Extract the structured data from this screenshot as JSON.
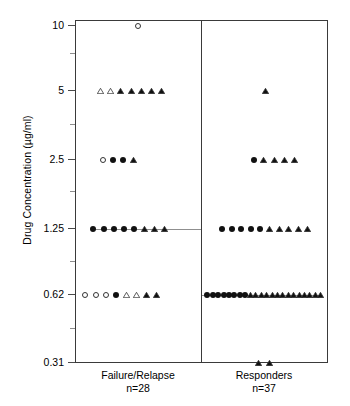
{
  "chart_data": {
    "type": "scatter",
    "title": "",
    "xlabel": "",
    "ylabel": "Drug Concentration (µg/ml)",
    "yscale": "log2",
    "ytick_labels": [
      "10",
      "5",
      "2.5",
      "1.25",
      "0.62",
      "0.31"
    ],
    "ytick_values": [
      10,
      5,
      2.5,
      1.25,
      0.62,
      0.31
    ],
    "ylim": [
      0.31,
      12
    ],
    "grid": false,
    "legend": "none",
    "reference_lines": [
      {
        "group": "Failure/Relapse",
        "value": 1.25,
        "label": ""
      },
      {
        "group": "Responders",
        "value": 0.62,
        "label": ""
      }
    ],
    "marker_kinds": [
      "circle-open",
      "circle-filled",
      "tri-open",
      "tri-filled"
    ],
    "groups": [
      {
        "name": "Failure/Relapse",
        "n_label": "n=28",
        "n": 28,
        "rows": [
          {
            "value": 10,
            "markers": [
              "circle-open"
            ]
          },
          {
            "value": 5,
            "markers": [
              "tri-open",
              "tri-open",
              "tri-filled",
              "tri-filled",
              "tri-filled",
              "tri-filled",
              "tri-filled"
            ]
          },
          {
            "value": 2.5,
            "markers": [
              "circle-open",
              "circle-filled",
              "circle-filled",
              "tri-filled"
            ]
          },
          {
            "value": 1.25,
            "markers": [
              "circle-filled",
              "circle-filled",
              "circle-filled",
              "circle-filled",
              "circle-filled",
              "tri-filled",
              "tri-filled",
              "tri-filled"
            ]
          },
          {
            "value": 0.62,
            "markers": [
              "circle-open",
              "circle-open",
              "circle-open",
              "circle-filled",
              "tri-open",
              "tri-open",
              "tri-filled",
              "tri-filled"
            ]
          }
        ]
      },
      {
        "name": "Responders",
        "n_label": "n=37",
        "n": 37,
        "rows": [
          {
            "value": 5,
            "markers": [
              "tri-filled"
            ]
          },
          {
            "value": 2.5,
            "markers": [
              "circle-filled",
              "tri-filled",
              "tri-filled",
              "tri-filled",
              "tri-filled"
            ]
          },
          {
            "value": 1.25,
            "markers": [
              "circle-filled",
              "circle-filled",
              "circle-filled",
              "circle-filled",
              "circle-filled",
              "tri-filled",
              "tri-filled",
              "tri-filled",
              "tri-filled",
              "tri-filled"
            ]
          },
          {
            "value": 0.62,
            "markers": [
              "circle-filled",
              "circle-filled",
              "circle-filled",
              "circle-filled",
              "circle-filled",
              "circle-filled",
              "circle-filled",
              "circle-filled",
              "tri-filled",
              "tri-filled",
              "tri-filled",
              "tri-filled",
              "tri-filled",
              "tri-filled",
              "tri-filled",
              "tri-filled",
              "tri-filled",
              "tri-filled",
              "tri-filled",
              "tri-filled",
              "tri-filled",
              "tri-filled"
            ]
          },
          {
            "value": 0.31,
            "markers": [
              "tri-filled",
              "tri-filled"
            ]
          }
        ]
      }
    ]
  },
  "axis": {
    "y_title": "Drug Concentration (µg/ml)",
    "ticks": [
      {
        "label": "10"
      },
      {
        "label": "5"
      },
      {
        "label": "2.5"
      },
      {
        "label": "1.25"
      },
      {
        "label": "0.62"
      },
      {
        "label": "0.31"
      }
    ]
  },
  "x_axis": {
    "groups": [
      {
        "name": "Failure/Relapse",
        "n_label": "n=28"
      },
      {
        "name": "Responders",
        "n_label": "n=37"
      }
    ]
  }
}
